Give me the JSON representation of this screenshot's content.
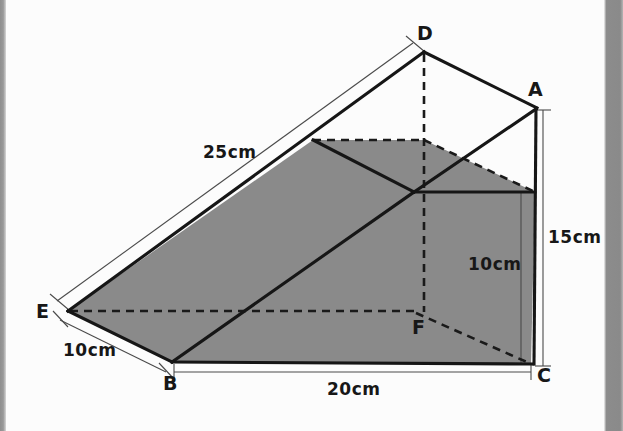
{
  "figure": {
    "shape_type": "triangular prism",
    "fill_color": "#8a8a8a",
    "line_color": "#1a1a1a",
    "background_color": "#fcfcfc",
    "vertices": [
      {
        "name": "A",
        "label": "A",
        "x": 537,
        "y": 108,
        "label_x": 528,
        "label_y": 78
      },
      {
        "name": "B",
        "label": "B",
        "x": 172,
        "y": 362,
        "label_x": 163,
        "label_y": 374
      },
      {
        "name": "C",
        "label": "C",
        "x": 531,
        "y": 364,
        "label_x": 537,
        "label_y": 367
      },
      {
        "name": "D",
        "label": "D",
        "x": 424,
        "y": 52,
        "label_x": 417,
        "label_y": 23
      },
      {
        "name": "E",
        "label": "E",
        "x": 68,
        "y": 311,
        "label_x": 36,
        "label_y": 302
      },
      {
        "name": "F",
        "label": "F",
        "x": 414,
        "y": 312,
        "label_x": 413,
        "label_y": 316
      }
    ],
    "dimensions": [
      {
        "name": "edge-ED",
        "label": "25cm",
        "value": 25,
        "unit": "cm",
        "label_x": 203,
        "label_y": 142
      },
      {
        "name": "edge-EB",
        "label": "10cm",
        "value": 10,
        "unit": "cm",
        "label_x": 63,
        "label_y": 340
      },
      {
        "name": "edge-BC",
        "label": "20cm",
        "value": 20,
        "unit": "cm",
        "label_x": 327,
        "label_y": 379
      },
      {
        "name": "edge-AC",
        "label": "15cm",
        "value": 15,
        "unit": "cm",
        "label_x": 548,
        "label_y": 227
      },
      {
        "name": "inner-height",
        "label": "10cm",
        "value": 10,
        "unit": "cm",
        "label_x": 468,
        "label_y": 254
      }
    ]
  }
}
